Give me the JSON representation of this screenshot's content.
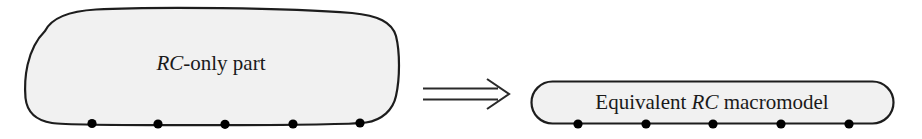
{
  "figure": {
    "background_color": "#ffffff",
    "shape_fill_color": "#f1f1f1",
    "shape_stroke_color": "#1d1d1d",
    "node_color": "#000000",
    "text_color": "#1a1a1a"
  },
  "source_block": {
    "label_prefix": "RC",
    "label_suffix": "-only part",
    "shape": "rounded-blob",
    "terminal_count": 5,
    "terminals": [
      {
        "name": "terminal-1",
        "x": 92
      },
      {
        "name": "terminal-2",
        "x": 158
      },
      {
        "name": "terminal-3",
        "x": 225
      },
      {
        "name": "terminal-4",
        "x": 293
      },
      {
        "name": "terminal-5",
        "x": 360
      }
    ]
  },
  "arrow": {
    "glyph_name": "double-line-right-arrow",
    "symbol": "⟹",
    "direction": "right"
  },
  "target_block": {
    "label_start": "Equivalent",
    "label_emphasis": "RC",
    "label_end": "macromodel",
    "shape": "capsule",
    "terminal_count": 5,
    "terminals": [
      {
        "name": "terminal-1",
        "x": 578
      },
      {
        "name": "terminal-2",
        "x": 646
      },
      {
        "name": "terminal-3",
        "x": 713
      },
      {
        "name": "terminal-4",
        "x": 781
      },
      {
        "name": "terminal-5",
        "x": 849
      }
    ]
  }
}
